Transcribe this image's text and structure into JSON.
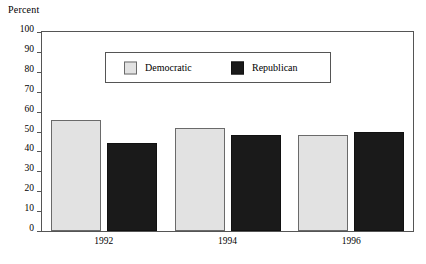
{
  "chart_data": {
    "type": "bar",
    "title": "",
    "subtitle": "",
    "xlabel": "",
    "ylabel": "Percent",
    "categories": [
      "1992",
      "1994",
      "1996"
    ],
    "series": [
      {
        "name": "Democratic",
        "values": [
          56,
          52,
          48
        ],
        "color": "#e2e2e2"
      },
      {
        "name": "Republican",
        "values": [
          44,
          48,
          50
        ],
        "color": "#1a1a1a"
      }
    ],
    "ylim": [
      0,
      100
    ],
    "yticks": [
      0,
      10,
      20,
      30,
      40,
      50,
      60,
      70,
      80,
      90,
      100
    ],
    "ytick_labels": [
      "0",
      "10",
      "20",
      "30",
      "40",
      "50",
      "60",
      "70",
      "80",
      "90",
      "100"
    ],
    "grid": false,
    "legend_position": "upper-center",
    "legend_entries": [
      {
        "label": "Democratic",
        "swatch": "light-gray-square"
      },
      {
        "label": "Republican",
        "swatch": "black-square"
      }
    ],
    "annotations": []
  }
}
